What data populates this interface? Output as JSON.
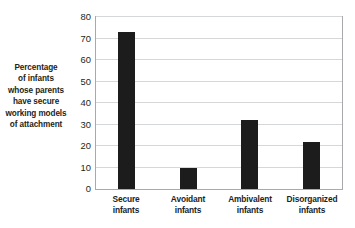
{
  "chart_data": {
    "type": "bar",
    "title": "",
    "subtitle": "",
    "xlabel": "",
    "ylabel": "Percentage of infants whose parents have secure working models of attachment",
    "ylabel_lines": [
      "Percentage",
      "of infants",
      "whose parents",
      "have secure",
      "working models",
      "of attachment"
    ],
    "categories": [
      "Secure infants",
      "Avoidant infants",
      "Ambivalent infants",
      "Disorganized infants"
    ],
    "category_lines": [
      [
        "Secure",
        "infants"
      ],
      [
        "Avoidant",
        "infants"
      ],
      [
        "Ambivalent",
        "infants"
      ],
      [
        "Disorganized",
        "infants"
      ]
    ],
    "values": [
      73,
      10,
      32,
      22
    ],
    "ylim": [
      0,
      80
    ],
    "ytick_values": [
      0,
      10,
      20,
      30,
      40,
      50,
      60,
      70,
      80
    ],
    "ytick_labels": [
      "0",
      "10",
      "20",
      "30",
      "40",
      "50",
      "60",
      "70",
      "80"
    ],
    "grid": true,
    "grid_axis": "y",
    "legend": false,
    "legend_position": "none",
    "colors": {
      "bar": "#1c1c1c",
      "gridline": "#d6d7d9",
      "frame": "#a7a9ac",
      "text": "#231f20",
      "background": "#ffffff"
    }
  }
}
